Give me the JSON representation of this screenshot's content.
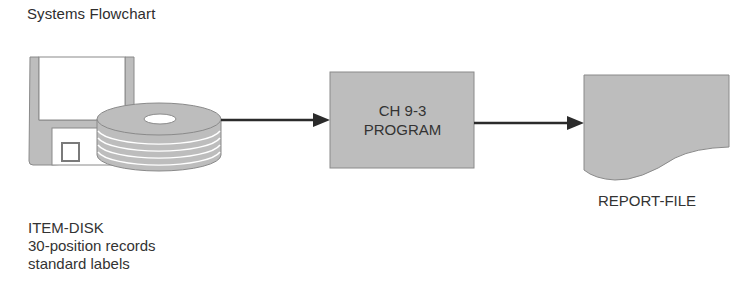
{
  "title": "Systems Flowchart",
  "colors": {
    "shape_fill": "#bdbdbd",
    "shape_stroke": "#8a8a8a",
    "arrow": "#2b2b2b",
    "text": "#333333"
  },
  "nodes": {
    "input": {
      "type": "disk-storage",
      "icon": "floppy-and-disk-icon",
      "caption": [
        "ITEM-DISK",
        "30-position records",
        "standard labels"
      ]
    },
    "process": {
      "type": "process",
      "lines": [
        "CH 9-3",
        "PROGRAM"
      ]
    },
    "output": {
      "type": "document",
      "label": "REPORT-FILE"
    }
  },
  "edges": [
    {
      "from": "input",
      "to": "process"
    },
    {
      "from": "process",
      "to": "output"
    }
  ]
}
